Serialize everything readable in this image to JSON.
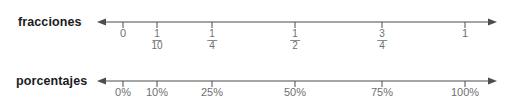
{
  "rows": [
    {
      "name": "fracciones",
      "label": "fracciones",
      "axis": {
        "line_y": 22,
        "x_start": 97,
        "x_end": 497,
        "left_arrow": true,
        "right_arrow": true,
        "tick_height": 6,
        "color": "#4d4d4d"
      },
      "ticks": [
        {
          "x": 123,
          "value": 0,
          "kind": "whole",
          "text": "0"
        },
        {
          "x": 157,
          "value": 0.1,
          "kind": "fraction",
          "numerator": "1",
          "denominator": "10",
          "text": "1/10"
        },
        {
          "x": 212,
          "value": 0.25,
          "kind": "fraction",
          "numerator": "1",
          "denominator": "4",
          "text": "1/4"
        },
        {
          "x": 295,
          "value": 0.5,
          "kind": "fraction",
          "numerator": "1",
          "denominator": "2",
          "text": "1/2"
        },
        {
          "x": 382,
          "value": 0.75,
          "kind": "fraction",
          "numerator": "3",
          "denominator": "4",
          "text": "3/4"
        },
        {
          "x": 465,
          "value": 1,
          "kind": "whole",
          "text": "1"
        }
      ],
      "tick_label_top": 28
    },
    {
      "name": "porcentajes",
      "label": "porcentajes",
      "axis": {
        "line_y": 81,
        "x_start": 97,
        "x_end": 497,
        "left_arrow": true,
        "right_arrow": true,
        "tick_height": 6,
        "color": "#4d4d4d"
      },
      "ticks": [
        {
          "x": 123,
          "value": 0,
          "kind": "percent",
          "text": "0%"
        },
        {
          "x": 157,
          "value": 10,
          "kind": "percent",
          "text": "10%"
        },
        {
          "x": 212,
          "value": 25,
          "kind": "percent",
          "text": "25%"
        },
        {
          "x": 295,
          "value": 50,
          "kind": "percent",
          "text": "50%"
        },
        {
          "x": 382,
          "value": 75,
          "kind": "percent",
          "text": "75%"
        },
        {
          "x": 465,
          "value": 100,
          "kind": "percent",
          "text": "100%"
        }
      ],
      "tick_label_top": 87
    }
  ],
  "chart_data": {
    "type": "table",
    "title": "",
    "xlabel": "",
    "ylabel": "",
    "grid": false,
    "legend": "none",
    "axes": [
      {
        "name": "fracciones",
        "tick_labels": [
          "0",
          "1/10",
          "1/4",
          "1/2",
          "3/4",
          "1"
        ],
        "values": [
          0,
          0.1,
          0.25,
          0.5,
          0.75,
          1
        ],
        "range": [
          0,
          1
        ],
        "arrows": "both"
      },
      {
        "name": "porcentajes",
        "tick_labels": [
          "0%",
          "10%",
          "25%",
          "50%",
          "75%",
          "100%"
        ],
        "values": [
          0,
          10,
          25,
          50,
          75,
          100
        ],
        "range": [
          0,
          100
        ],
        "arrows": "both"
      }
    ],
    "pairs": [
      {
        "fraccion": "0",
        "porcentaje": "0%"
      },
      {
        "fraccion": "1/10",
        "porcentaje": "10%"
      },
      {
        "fraccion": "1/4",
        "porcentaje": "25%"
      },
      {
        "fraccion": "1/2",
        "porcentaje": "50%"
      },
      {
        "fraccion": "3/4",
        "porcentaje": "75%"
      },
      {
        "fraccion": "1",
        "porcentaje": "100%"
      }
    ],
    "colors": {
      "axis": "#4d4d4d",
      "tick_label": "#6f6f6f",
      "row_label": "#1b1b1b",
      "background": "#ffffff"
    }
  }
}
